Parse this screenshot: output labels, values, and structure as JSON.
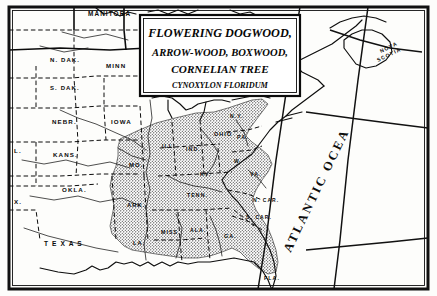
{
  "map": {
    "kind": "botanical-range-map",
    "medium": "engraving",
    "frame_color": "#111111",
    "paper_color": "#fdfdfb",
    "ink_color": "#0b0b0b",
    "range_shading": "stipple",
    "title_box": {
      "lines": [
        "FLOWERING DOGWOOD,",
        "ARROW-WOOD, BOXWOOD,",
        "CORNELIAN TREE"
      ],
      "species": "CYNOXYLON FLORIDUM"
    },
    "ocean_label": "ATLANTIC OCEAN",
    "regions": [
      {
        "name": "MANITOBA",
        "x": 88,
        "y": 16,
        "size": 6.4
      },
      {
        "name": "NOVA",
        "x": 381,
        "y": 53,
        "size": 5.2,
        "rot": -26
      },
      {
        "name": "SCOTIA",
        "x": 378,
        "y": 62,
        "size": 5.2,
        "rot": -26
      },
      {
        "name": "N. DAK.",
        "x": 50,
        "y": 62,
        "size": 6.0
      },
      {
        "name": "MINN",
        "x": 106,
        "y": 68,
        "size": 6.2
      },
      {
        "name": "S. DAK.",
        "x": 50,
        "y": 90,
        "size": 6.0
      },
      {
        "name": "NEBR.",
        "x": 52,
        "y": 124,
        "size": 6.2
      },
      {
        "name": "IOWA",
        "x": 111,
        "y": 124,
        "size": 6.2
      },
      {
        "name": "L.",
        "x": 14,
        "y": 153,
        "size": 6.2
      },
      {
        "name": "KANS.",
        "x": 53,
        "y": 157,
        "size": 6.2
      },
      {
        "name": "OKLA.",
        "x": 62,
        "y": 192,
        "size": 6.2
      },
      {
        "name": "X.",
        "x": 14,
        "y": 204,
        "size": 6.2
      },
      {
        "name": "T E X A S",
        "x": 44,
        "y": 246,
        "size": 6.6
      },
      {
        "name": "MO.",
        "x": 129,
        "y": 167,
        "size": 6.0
      },
      {
        "name": "ARK.",
        "x": 127,
        "y": 207,
        "size": 5.8
      },
      {
        "name": "LA.",
        "x": 133,
        "y": 245,
        "size": 5.6
      },
      {
        "name": "ILL.",
        "x": 162,
        "y": 148,
        "size": 5.2
      },
      {
        "name": "IND.",
        "x": 186,
        "y": 151,
        "size": 5.2
      },
      {
        "name": "OHIO",
        "x": 214,
        "y": 136,
        "size": 5.4
      },
      {
        "name": "KY.",
        "x": 200,
        "y": 176,
        "size": 5.2
      },
      {
        "name": "TENN.",
        "x": 187,
        "y": 197,
        "size": 5.2
      },
      {
        "name": "MISS.",
        "x": 161,
        "y": 234,
        "size": 5.2
      },
      {
        "name": "ALA.",
        "x": 190,
        "y": 232,
        "size": 5.2
      },
      {
        "name": "GA.",
        "x": 224,
        "y": 238,
        "size": 5.4
      },
      {
        "name": "FLA.",
        "x": 264,
        "y": 280,
        "size": 5.2
      },
      {
        "name": "S. CAR.",
        "x": 246,
        "y": 219,
        "size": 5.0
      },
      {
        "name": "N. CAR.",
        "x": 253,
        "y": 202,
        "size": 5.0
      },
      {
        "name": "VA.",
        "x": 250,
        "y": 176,
        "size": 5.2
      },
      {
        "name": "W.",
        "x": 234,
        "y": 163,
        "size": 5.0
      },
      {
        "name": "PA.",
        "x": 237,
        "y": 139,
        "size": 5.2
      },
      {
        "name": "N.Y.",
        "x": 230,
        "y": 118,
        "size": 5.0
      }
    ],
    "graticule": {
      "meridians": 3,
      "parallels": 2
    }
  }
}
